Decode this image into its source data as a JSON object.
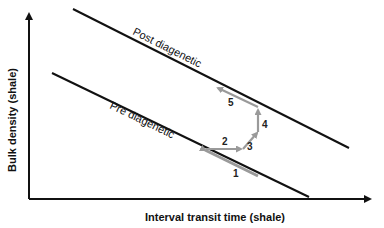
{
  "diagram": {
    "x_axis_label": "Interval transit time (shale)",
    "y_axis_label": "Bulk density (shale)",
    "lines": [
      {
        "name": "post-diagenetic",
        "label": "Post diagenetic"
      },
      {
        "name": "pre-diagenetic",
        "label": "Pre diagenetic"
      }
    ],
    "steps": [
      "1",
      "2",
      "3",
      "4",
      "5"
    ],
    "colors": {
      "axis": "#111111",
      "trend_line": "#111111",
      "path": "#9a9a9a",
      "background": "#ffffff"
    }
  }
}
